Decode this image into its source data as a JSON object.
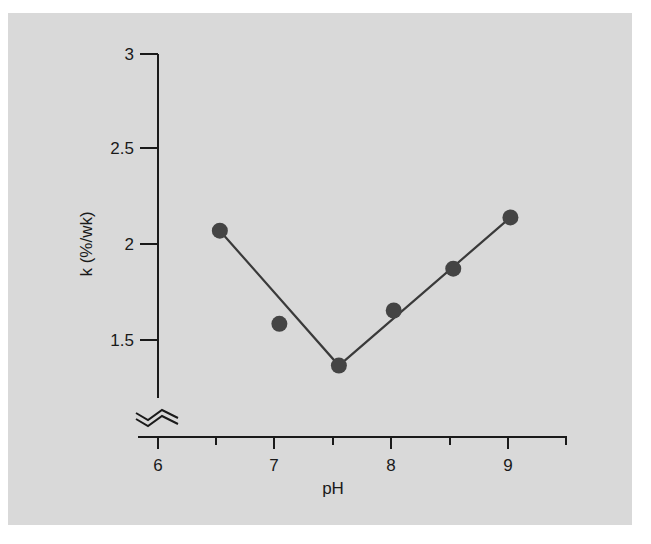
{
  "chart_data": {
    "type": "scatter",
    "title": "",
    "xlabel": "pH",
    "ylabel": "k (%/wk)",
    "xlim": [
      6,
      9.5
    ],
    "ylim": [
      1.2,
      3
    ],
    "y_axis_break": true,
    "grid": false,
    "legend": null,
    "x_ticks": [
      6,
      6.5,
      7,
      7.5,
      8,
      8.5,
      9,
      9.5
    ],
    "x_tick_labels": [
      "6",
      "",
      "7",
      "",
      "8",
      "",
      "9",
      ""
    ],
    "y_ticks": [
      1.5,
      2,
      2.5,
      3
    ],
    "y_tick_labels": [
      "1.5",
      "2",
      "2.5",
      "3"
    ],
    "series": [
      {
        "name": "measured",
        "type": "scatter",
        "x": [
          6.53,
          7.04,
          7.55,
          8.02,
          8.53,
          9.02
        ],
        "y": [
          2.07,
          1.58,
          1.36,
          1.65,
          1.87,
          2.14
        ]
      },
      {
        "name": "fit",
        "type": "line",
        "x": [
          6.53,
          7.55,
          9.02
        ],
        "y": [
          2.07,
          1.36,
          2.14
        ]
      }
    ]
  },
  "labels": {
    "xlabel": "pH",
    "ylabel": "k (%/wk)",
    "yticks": [
      "3",
      "2.5",
      "2",
      "1.5"
    ],
    "xticks": [
      "6",
      "7",
      "8",
      "9"
    ]
  },
  "colors": {
    "background": "#d9d9d9",
    "axis": "#1a1a1a",
    "points": "#444444",
    "line": "#3a3a3a"
  }
}
